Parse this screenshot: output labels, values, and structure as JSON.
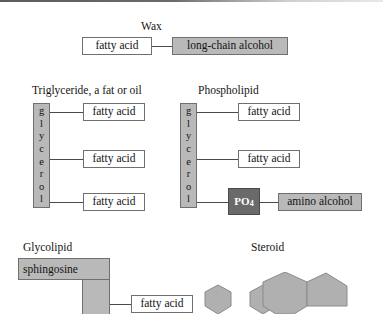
{
  "figure": {
    "background_color": "#ffffff",
    "shaded_fill": "#b9b9b9",
    "dark_fill": "#6a6a6a",
    "line_color": "#4a4a4a",
    "width": 383,
    "height": 314
  },
  "sections": {
    "wax": {
      "title": "Wax",
      "fatty_acid": "fatty acid",
      "long_chain_alcohol": "long-chain alcohol"
    },
    "triglyceride": {
      "title": "Triglyceride, a fat or oil",
      "glycerol_letters": [
        "g",
        "l",
        "y",
        "c",
        "e",
        "r",
        "o",
        "l"
      ],
      "fatty_acids": [
        "fatty acid",
        "fatty acid",
        "fatty acid"
      ]
    },
    "phospholipid": {
      "title": "Phospholipid",
      "glycerol_letters": [
        "g",
        "l",
        "y",
        "c",
        "e",
        "r",
        "o",
        "l"
      ],
      "fatty_acids": [
        "fatty acid",
        "fatty acid"
      ],
      "phosphate": "PO",
      "phosphate_subscript": "4",
      "amino_alcohol": "amino alcohol"
    },
    "glycolipid": {
      "title": "Glycolipid",
      "sphingosine": "sphingosine",
      "fatty_acid": "fatty acid"
    },
    "steroid": {
      "title": "Steroid",
      "ring_count": 3,
      "ring_shapes": [
        "hexagon",
        "hexagon",
        "pentagon"
      ]
    }
  }
}
